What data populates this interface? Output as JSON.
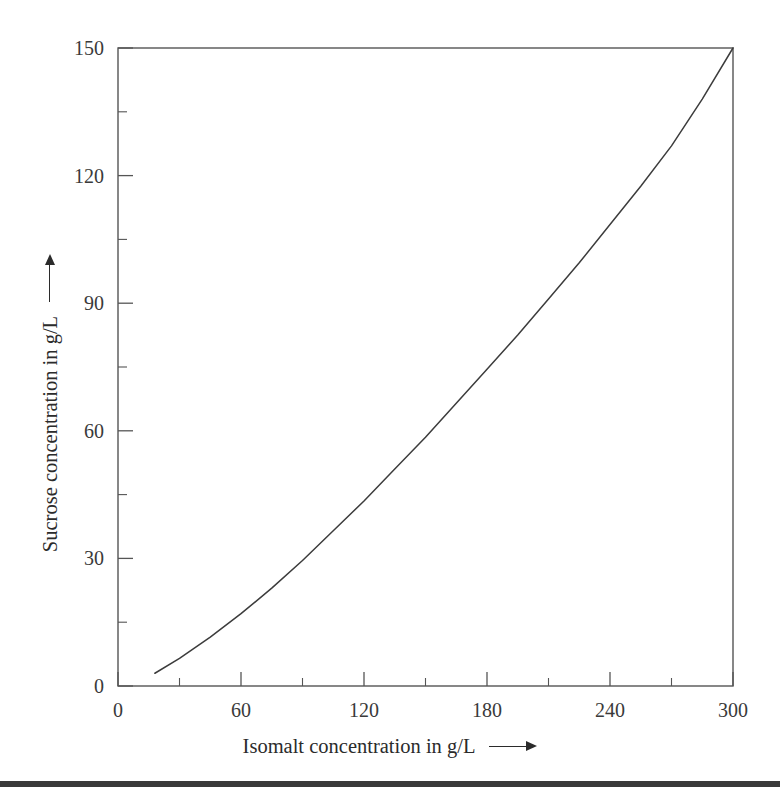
{
  "chart_data": {
    "type": "line",
    "title": "",
    "subtitle": "",
    "xlabel": "Isomalt concentration in g/L",
    "ylabel": "Sucrose concentration in g/L",
    "xlim": [
      0,
      300
    ],
    "ylim": [
      0,
      150
    ],
    "grid": false,
    "legend": null,
    "legend_position": "none",
    "x_major_ticks": [
      0,
      60,
      120,
      180,
      240,
      300
    ],
    "x_minor_ticks": [
      30,
      90,
      150,
      210,
      270
    ],
    "y_major_ticks": [
      0,
      30,
      60,
      90,
      120,
      150
    ],
    "y_minor_ticks": [
      15,
      45,
      75,
      105,
      135
    ],
    "x_tick_labels": [
      "0",
      "60",
      "120",
      "180",
      "240",
      "300"
    ],
    "y_tick_labels": [
      "0",
      "30",
      "60",
      "90",
      "120",
      "150"
    ],
    "series": [
      {
        "name": "Solubility isotherm",
        "color": "#3c3c3c",
        "x": [
          18,
          30,
          45,
          60,
          75,
          90,
          105,
          120,
          135,
          150,
          165,
          180,
          195,
          210,
          225,
          240,
          255,
          270,
          285,
          300
        ],
        "y": [
          3,
          6.5,
          11.5,
          17,
          23,
          29.5,
          36.5,
          43.5,
          51,
          58.5,
          66.5,
          74.5,
          82.5,
          91,
          99.5,
          108.5,
          117.5,
          127,
          138,
          150
        ]
      }
    ],
    "annotations": {
      "x_axis_arrow": "right-arrow",
      "y_axis_arrow": "up-arrow"
    }
  },
  "axes": {
    "x_title": "Isomalt concentration in g/L",
    "y_title": "Sucrose concentration in g/L"
  },
  "colors": {
    "curve": "#3c3c3c",
    "frame": "#555555",
    "text": "#2b2b2b",
    "footer_rule": "#3a3a3a",
    "background": "#ffffff"
  }
}
